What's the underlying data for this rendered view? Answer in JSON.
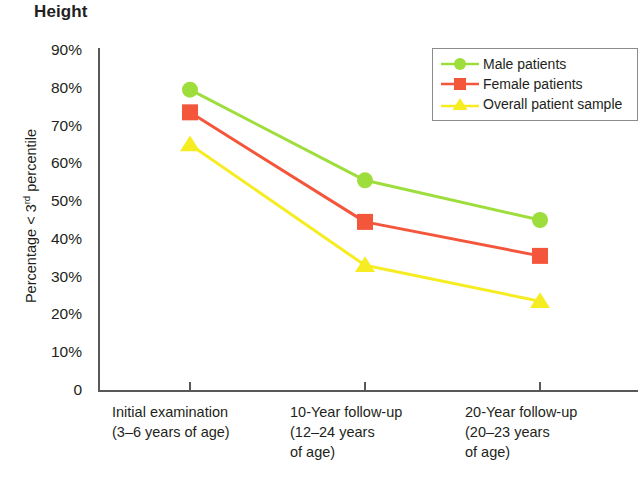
{
  "chart_data": {
    "type": "line",
    "title": "Height",
    "subtitle": "",
    "xlabel": "",
    "ylabel": "Percentage < 3rd percentile",
    "ylabel_prefix": "Percentage < 3",
    "ylabel_superscript": "rd",
    "ylabel_suffix": " percentile",
    "categories": [
      "Initial examination\n(3–6 years of age)",
      "10-Year follow-up\n(12–24 years\nof age)",
      "20-Year follow-up\n(20–23 years\nof age)"
    ],
    "category_lines": [
      [
        "Initial examination",
        "(3–6 years of age)"
      ],
      [
        "10-Year follow-up",
        "(12–24 years",
        "of age)"
      ],
      [
        "20-Year follow-up",
        "(20–23 years",
        "of age)"
      ]
    ],
    "series": [
      {
        "name": "Male patients",
        "values": [
          79.5,
          55.5,
          45.0
        ],
        "color": "#9ede3c",
        "marker": "circle"
      },
      {
        "name": "Female patients",
        "values": [
          73.5,
          44.5,
          35.5
        ],
        "color": "#f4563c",
        "marker": "square"
      },
      {
        "name": "Overall patient sample",
        "values": [
          65.0,
          33.0,
          23.5
        ],
        "color": "#f5ec22",
        "marker": "triangle"
      }
    ],
    "ylim": [
      0,
      90
    ],
    "ytick_values": [
      90,
      80,
      70,
      60,
      50,
      40,
      30,
      20,
      10,
      0
    ],
    "ytick_labels": [
      "90%",
      "80%",
      "70%",
      "60%",
      "50%",
      "40%",
      "30%",
      "20%",
      "10%",
      "0"
    ],
    "grid": false,
    "legend_position": "top-right"
  },
  "legend": {
    "entries": [
      {
        "label": "Male patients",
        "marker": "circle-marker",
        "color": "#9ede3c"
      },
      {
        "label": "Female patients",
        "marker": "square-marker",
        "color": "#f4563c"
      },
      {
        "label": "Overall patient sample",
        "marker": "triangle-marker",
        "color": "#f5ec22"
      }
    ]
  }
}
